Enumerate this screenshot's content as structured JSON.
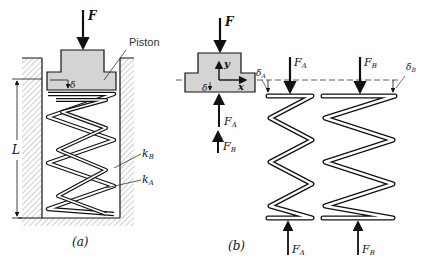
{
  "figure_a": {
    "caption": "(a)",
    "force_label": "F",
    "piston_label": "Piston",
    "delta_label": "δ",
    "length_label": "L",
    "spring_outer_label": "k",
    "spring_outer_sub": "B",
    "spring_inner_label": "k",
    "spring_inner_sub": "A"
  },
  "figure_b": {
    "caption": "(b)",
    "force_label": "F",
    "axis_y_label": "y",
    "axis_x_label": "x",
    "delta_label": "δ",
    "fa_label": "F",
    "fa_sub": "A",
    "fb_label": "F",
    "fb_sub": "B",
    "delta_a_label": "δ",
    "delta_a_sub": "A",
    "delta_b_label": "δ",
    "delta_b_sub": "B",
    "spring_a_top_force": "F",
    "spring_a_top_sub": "A",
    "spring_b_top_force": "F",
    "spring_b_top_sub": "B",
    "spring_a_bottom_force": "F",
    "spring_a_bottom_sub": "A",
    "spring_b_bottom_force": "F",
    "spring_b_bottom_sub": "B"
  }
}
